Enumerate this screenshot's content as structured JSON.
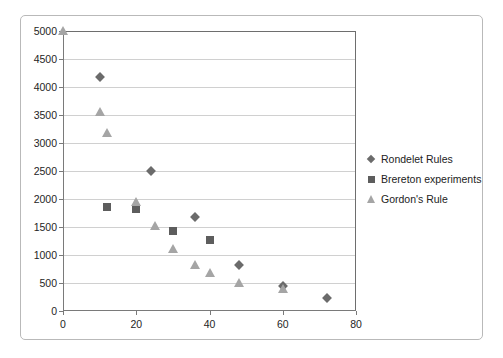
{
  "chart_data": {
    "type": "scatter",
    "title": "",
    "xlabel": "",
    "ylabel": "",
    "xlim": [
      0,
      80
    ],
    "ylim": [
      0,
      5000
    ],
    "xticks": [
      0,
      20,
      40,
      60,
      80
    ],
    "yticks": [
      0,
      500,
      1000,
      1500,
      2000,
      2500,
      3000,
      3500,
      4000,
      4500,
      5000
    ],
    "grid": "horizontal",
    "legend_position": "right",
    "series": [
      {
        "name": "Rondelet Rules",
        "marker": "diamond",
        "color": "#6b6b6b",
        "points": [
          {
            "x": 10,
            "y": 4170
          },
          {
            "x": 24,
            "y": 2500
          },
          {
            "x": 36,
            "y": 1680
          },
          {
            "x": 48,
            "y": 830
          },
          {
            "x": 60,
            "y": 450
          },
          {
            "x": 72,
            "y": 230
          }
        ]
      },
      {
        "name": "Brereton experiments",
        "marker": "square",
        "color": "#5d5d5d",
        "points": [
          {
            "x": 12,
            "y": 1860
          },
          {
            "x": 20,
            "y": 1820
          },
          {
            "x": 30,
            "y": 1420
          },
          {
            "x": 40,
            "y": 1260
          }
        ]
      },
      {
        "name": "Gordon's Rule",
        "marker": "triangle",
        "color": "#a5a5a5",
        "points": [
          {
            "x": 0,
            "y": 5000
          },
          {
            "x": 10,
            "y": 3560
          },
          {
            "x": 12,
            "y": 3170
          },
          {
            "x": 20,
            "y": 1950
          },
          {
            "x": 25,
            "y": 1510
          },
          {
            "x": 30,
            "y": 1100
          },
          {
            "x": 36,
            "y": 830
          },
          {
            "x": 40,
            "y": 670
          },
          {
            "x": 48,
            "y": 500
          },
          {
            "x": 60,
            "y": 400
          }
        ]
      }
    ]
  }
}
